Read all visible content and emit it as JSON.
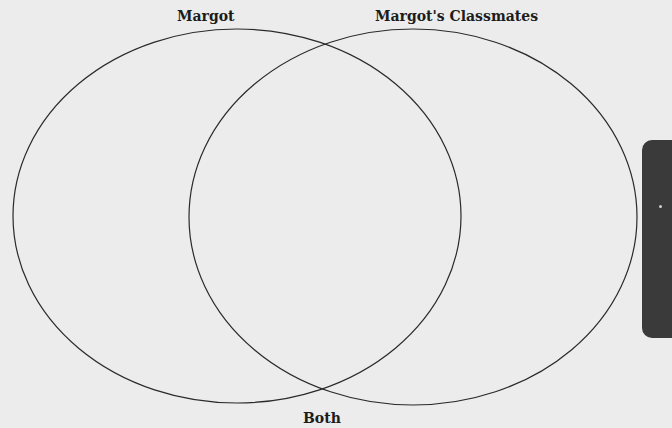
{
  "diagram": {
    "type": "venn",
    "sets": [
      {
        "label": "Margot",
        "cx": 237,
        "cy": 216,
        "rx": 224,
        "ry": 187
      },
      {
        "label": "Margot's Classmates",
        "cx": 413,
        "cy": 217,
        "rx": 224,
        "ry": 188
      }
    ],
    "intersection_label": "Both",
    "stroke_color": "#2a2a2a",
    "background_color": "#ececec",
    "side_tab_color": "#3a3a3a"
  }
}
